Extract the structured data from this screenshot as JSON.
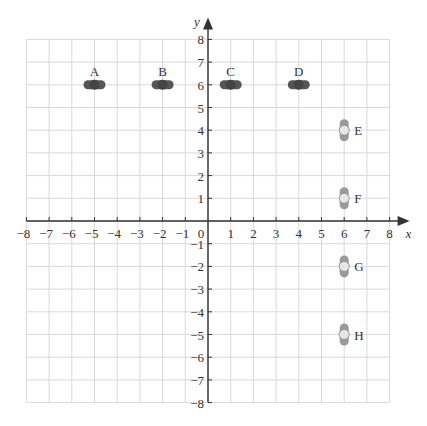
{
  "figure": {
    "axes": {
      "x_label": "x",
      "y_label": "y",
      "x_ticks": [
        "−8",
        "−7",
        "−6",
        "−5",
        "−4",
        "−3",
        "−2",
        "−1",
        "0",
        "1",
        "2",
        "3",
        "4",
        "5",
        "6",
        "7",
        "8"
      ],
      "y_ticks": [
        "8",
        "7",
        "6",
        "5",
        "4",
        "3",
        "2",
        "1",
        "−1",
        "−2",
        "−3",
        "−4",
        "−5",
        "−6",
        "−7",
        "−8"
      ],
      "x_range": [
        -8,
        8
      ],
      "y_range": [
        -8,
        8
      ],
      "origin_label": "0"
    },
    "colors": {
      "grid": "#d9d9d9",
      "axis": "#333333",
      "dark_shape": "#555555",
      "light_shape": "#9a9a9a",
      "light_circle": "#e6e6e6"
    }
  },
  "chart_data": {
    "type": "scatter",
    "title": "",
    "xlabel": "x",
    "ylabel": "y",
    "xlim": [
      -8,
      8
    ],
    "ylim": [
      -8,
      8
    ],
    "grid": true,
    "points": [
      {
        "label": "A",
        "x": -5,
        "y": 6,
        "orientation": "horizontal",
        "shade": "dark"
      },
      {
        "label": "B",
        "x": -2,
        "y": 6,
        "orientation": "horizontal",
        "shade": "dark"
      },
      {
        "label": "C",
        "x": 1,
        "y": 6,
        "orientation": "horizontal",
        "shade": "dark"
      },
      {
        "label": "D",
        "x": 4,
        "y": 6,
        "orientation": "horizontal",
        "shade": "dark"
      },
      {
        "label": "E",
        "x": 6,
        "y": 4,
        "orientation": "vertical",
        "shade": "light"
      },
      {
        "label": "F",
        "x": 6,
        "y": 1,
        "orientation": "vertical",
        "shade": "light"
      },
      {
        "label": "G",
        "x": 6,
        "y": -2,
        "orientation": "vertical",
        "shade": "light"
      },
      {
        "label": "H",
        "x": 6,
        "y": -5,
        "orientation": "vertical",
        "shade": "light"
      }
    ]
  }
}
